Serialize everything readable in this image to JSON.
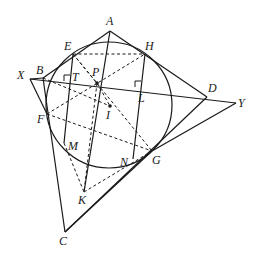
{
  "diagram": {
    "type": "geometry",
    "stroke_color": "#1a1a1a",
    "circle": {
      "cx": 109,
      "cy": 105,
      "r": 63
    },
    "points": {
      "A": {
        "label": "A",
        "x": 110,
        "y": 31,
        "lx": 106,
        "ly": 25
      },
      "B": {
        "label": "B",
        "x": 43,
        "y": 78,
        "lx": 36,
        "ly": 74
      },
      "C": {
        "label": "C",
        "x": 65,
        "y": 232,
        "lx": 59,
        "ly": 245
      },
      "D": {
        "label": "D",
        "x": 207,
        "y": 97,
        "lx": 208,
        "ly": 92
      },
      "E": {
        "label": "E",
        "x": 73,
        "y": 54,
        "lx": 64,
        "ly": 50
      },
      "F": {
        "label": "F",
        "x": 47,
        "y": 114,
        "lx": 37,
        "ly": 123
      },
      "G": {
        "label": "G",
        "x": 152,
        "y": 151,
        "lx": 152,
        "ly": 164
      },
      "H": {
        "label": "H",
        "x": 145,
        "y": 54,
        "lx": 145,
        "ly": 50
      },
      "I": {
        "label": "I",
        "x": 110,
        "y": 106,
        "lx": 106,
        "ly": 119
      },
      "K": {
        "label": "K",
        "x": 84,
        "y": 192,
        "lx": 78,
        "ly": 204
      },
      "L": {
        "label": "L",
        "x": 141,
        "y": 87,
        "lx": 138,
        "ly": 102
      },
      "M": {
        "label": "M",
        "x": 64,
        "y": 143,
        "lx": 68,
        "ly": 150
      },
      "N": {
        "label": "N",
        "x": 133,
        "y": 159,
        "lx": 120,
        "ly": 166
      },
      "P": {
        "label": "P",
        "x": 97,
        "y": 83,
        "lx": 92,
        "ly": 76
      },
      "T": {
        "label": "T",
        "x": 70,
        "y": 81,
        "lx": 72,
        "ly": 81
      },
      "X": {
        "label": "X",
        "x": 30,
        "y": 79,
        "lx": 17,
        "ly": 79
      },
      "Y": {
        "label": "Y",
        "x": 236,
        "y": 103,
        "lx": 238,
        "ly": 107
      }
    },
    "solid_segments": [
      [
        "A",
        "B"
      ],
      [
        "A",
        "D"
      ],
      [
        "B",
        "C"
      ],
      [
        "C",
        "D"
      ],
      [
        "X",
        "Y"
      ],
      [
        "X",
        "F"
      ],
      [
        "C",
        "G"
      ],
      [
        "G",
        "Y"
      ],
      [
        "A",
        "K"
      ],
      [
        "E",
        "M"
      ],
      [
        "H",
        "N"
      ],
      [
        "X",
        "B"
      ]
    ],
    "dashed_segments": [
      [
        "E",
        "H"
      ],
      [
        "E",
        "G"
      ],
      [
        "F",
        "H"
      ],
      [
        "F",
        "G"
      ],
      [
        "B",
        "I"
      ],
      [
        "P",
        "I"
      ],
      [
        "E",
        "P"
      ],
      [
        "P",
        "K"
      ],
      [
        "M",
        "K"
      ],
      [
        "K",
        "G"
      ]
    ],
    "right_angle_marks": [
      "T",
      "L"
    ]
  }
}
